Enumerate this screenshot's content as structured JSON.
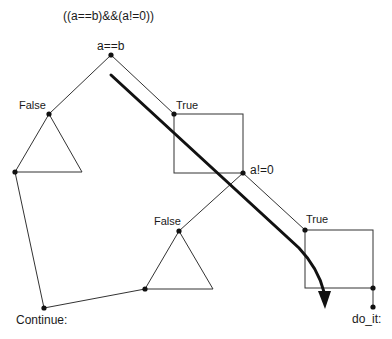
{
  "diagram": {
    "title": "((a==b)&&(a!=0))",
    "nodes": {
      "root": {
        "label": "a==b"
      },
      "false_1": {
        "label": "False"
      },
      "true_1": {
        "label": "True"
      },
      "second_test": {
        "label": "a!=0"
      },
      "false_2": {
        "label": "False"
      },
      "true_2": {
        "label": "True"
      },
      "continue": {
        "label": "Continue:"
      },
      "do_it": {
        "label": "do_it:"
      }
    },
    "colors": {
      "line": "#333333",
      "arrow": "#111111",
      "background": "#ffffff"
    }
  }
}
